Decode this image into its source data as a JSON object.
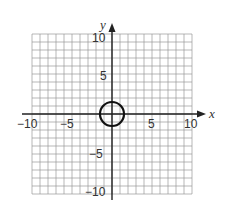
{
  "chart_data": {
    "type": "scatter",
    "title": "",
    "xlabel": "x",
    "ylabel": "y",
    "xlim": [
      -10,
      10
    ],
    "ylim": [
      -10,
      10
    ],
    "grid": true,
    "x_ticks": [
      -10,
      -5,
      5,
      10
    ],
    "y_ticks": [
      10,
      5,
      -5,
      -10
    ],
    "x_tick_labels": [
      "−10",
      "−5",
      "5",
      "10"
    ],
    "y_tick_labels": [
      "10",
      "5",
      "−5",
      "−10"
    ],
    "shapes": [
      {
        "type": "circle",
        "center": [
          0,
          0
        ],
        "radius": 1.5
      }
    ]
  },
  "labels": {
    "x_axis": "x",
    "y_axis": "y",
    "xt_m10": "−10",
    "xt_m5": "−5",
    "xt_5": "5",
    "xt_10": "10",
    "yt_10": "10",
    "yt_5": "5",
    "yt_m5": "−5",
    "yt_m10": "−10"
  }
}
